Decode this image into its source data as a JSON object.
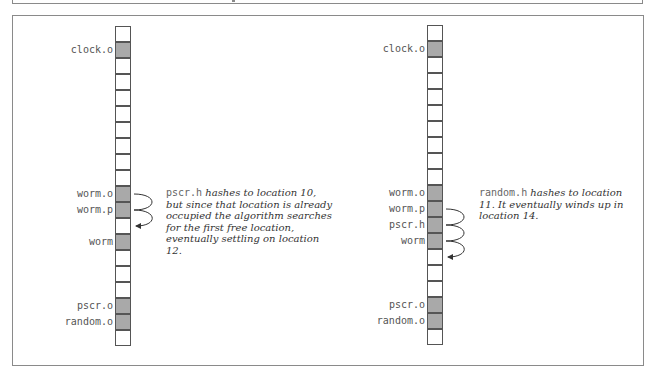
{
  "diagram": {
    "colors": {
      "filled": "#a9a9a9",
      "border": "#555555",
      "frame": "#8a8a8a"
    },
    "left": {
      "cells": [
        {
          "index": 0,
          "filled": false,
          "label": ""
        },
        {
          "index": 1,
          "filled": true,
          "label": "clock.o"
        },
        {
          "index": 2,
          "filled": false,
          "label": ""
        },
        {
          "index": 3,
          "filled": false,
          "label": ""
        },
        {
          "index": 4,
          "filled": false,
          "label": ""
        },
        {
          "index": 5,
          "filled": false,
          "label": ""
        },
        {
          "index": 6,
          "filled": false,
          "label": ""
        },
        {
          "index": 7,
          "filled": false,
          "label": ""
        },
        {
          "index": 8,
          "filled": false,
          "label": ""
        },
        {
          "index": 9,
          "filled": false,
          "label": ""
        },
        {
          "index": 10,
          "filled": true,
          "label": "worm.o"
        },
        {
          "index": 11,
          "filled": true,
          "label": "worm.p"
        },
        {
          "index": 12,
          "filled": false,
          "label": ""
        },
        {
          "index": 13,
          "filled": true,
          "label": "worm"
        },
        {
          "index": 14,
          "filled": false,
          "label": ""
        },
        {
          "index": 15,
          "filled": false,
          "label": ""
        },
        {
          "index": 16,
          "filled": false,
          "label": ""
        },
        {
          "index": 17,
          "filled": true,
          "label": "pscr.o"
        },
        {
          "index": 18,
          "filled": true,
          "label": "random.o"
        },
        {
          "index": 19,
          "filled": false,
          "label": ""
        }
      ],
      "note": {
        "code": "pscr.h",
        "text": " hashes to location 10, but since that location is already occupied the algorithm searches for the first free location, eventually settling on location 12."
      }
    },
    "right": {
      "cells": [
        {
          "index": 0,
          "filled": false,
          "label": ""
        },
        {
          "index": 1,
          "filled": true,
          "label": "clock.o"
        },
        {
          "index": 2,
          "filled": false,
          "label": ""
        },
        {
          "index": 3,
          "filled": false,
          "label": ""
        },
        {
          "index": 4,
          "filled": false,
          "label": ""
        },
        {
          "index": 5,
          "filled": false,
          "label": ""
        },
        {
          "index": 6,
          "filled": false,
          "label": ""
        },
        {
          "index": 7,
          "filled": false,
          "label": ""
        },
        {
          "index": 8,
          "filled": false,
          "label": ""
        },
        {
          "index": 9,
          "filled": false,
          "label": ""
        },
        {
          "index": 10,
          "filled": true,
          "label": "worm.o"
        },
        {
          "index": 11,
          "filled": true,
          "label": "worm.p"
        },
        {
          "index": 12,
          "filled": true,
          "label": "pscr.h"
        },
        {
          "index": 13,
          "filled": true,
          "label": "worm"
        },
        {
          "index": 14,
          "filled": false,
          "label": ""
        },
        {
          "index": 15,
          "filled": false,
          "label": ""
        },
        {
          "index": 16,
          "filled": false,
          "label": ""
        },
        {
          "index": 17,
          "filled": true,
          "label": "pscr.o"
        },
        {
          "index": 18,
          "filled": true,
          "label": "random.o"
        },
        {
          "index": 19,
          "filled": false,
          "label": ""
        }
      ],
      "note": {
        "code": "random.h",
        "text": " hashes to location 11. It eventually winds up in location 14."
      }
    }
  }
}
